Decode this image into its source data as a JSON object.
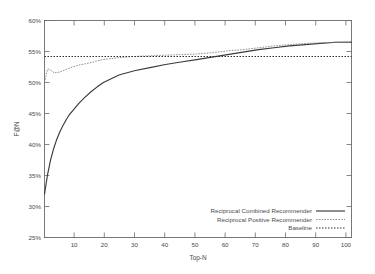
{
  "chart_data": {
    "type": "line",
    "title": "",
    "xlabel": "Top-N",
    "ylabel": "F@N",
    "xlim": [
      1,
      100
    ],
    "ylim": [
      25,
      60
    ],
    "grid": false,
    "legend_position": "bottom-right",
    "xticks": [
      10,
      20,
      30,
      40,
      50,
      60,
      70,
      80,
      90,
      100
    ],
    "xtick_labels": [
      "10",
      "20",
      "30",
      "40",
      "50",
      "60",
      "70",
      "80",
      "90",
      "100"
    ],
    "yticks": [
      25,
      30,
      35,
      40,
      45,
      50,
      55,
      60
    ],
    "ytick_labels": [
      "25%",
      "30%",
      "35%",
      "40%",
      "45%",
      "50%",
      "55%",
      "60%"
    ],
    "x": [
      1,
      2,
      3,
      4,
      5,
      6,
      7,
      8,
      9,
      10,
      12,
      14,
      16,
      18,
      20,
      25,
      30,
      35,
      40,
      45,
      50,
      55,
      60,
      65,
      70,
      75,
      80,
      85,
      90,
      95,
      100
    ],
    "series": [
      {
        "name": "Reciprocal Combined Recommender",
        "style": "solid",
        "color": "#3a3a3a",
        "values": [
          32.0,
          35.2,
          37.6,
          39.4,
          40.9,
          42.1,
          43.1,
          44.0,
          44.8,
          45.4,
          46.6,
          47.6,
          48.5,
          49.3,
          50.0,
          51.2,
          51.9,
          52.4,
          52.9,
          53.3,
          53.7,
          54.1,
          54.5,
          54.9,
          55.3,
          55.6,
          55.9,
          56.1,
          56.3,
          56.5,
          56.5
        ]
      },
      {
        "name": "Reciprocal Positive Recommender",
        "style": "dashed",
        "color": "#8a8a8a",
        "values": [
          50.0,
          52.2,
          52.0,
          51.6,
          51.6,
          51.7,
          51.9,
          52.1,
          52.3,
          52.5,
          52.8,
          53.0,
          53.2,
          53.5,
          53.7,
          54.0,
          54.2,
          54.3,
          54.4,
          54.5,
          54.6,
          54.8,
          55.1,
          55.3,
          55.6,
          55.9,
          56.1,
          56.3,
          56.4,
          56.5,
          56.6
        ]
      },
      {
        "name": "Baseline",
        "style": "dotted",
        "color": "#3a3a3a",
        "constant": 54.2,
        "values": [
          54.2,
          54.2,
          54.2,
          54.2,
          54.2,
          54.2,
          54.2,
          54.2,
          54.2,
          54.2,
          54.2,
          54.2,
          54.2,
          54.2,
          54.2,
          54.2,
          54.2,
          54.2,
          54.2,
          54.2,
          54.2,
          54.2,
          54.2,
          54.2,
          54.2,
          54.2,
          54.2,
          54.2,
          54.2,
          54.2,
          54.2
        ]
      }
    ]
  },
  "legend": {
    "items": [
      {
        "label": "Reciprocal Combined Recommender",
        "style": "solid"
      },
      {
        "label": "Reciprocal Positive Recommender",
        "style": "dashed"
      },
      {
        "label": "Baseline",
        "style": "dotted"
      }
    ]
  },
  "colors": {
    "background": "#ffffff",
    "axis": "#6b6b6b",
    "text": "#4a4a4a",
    "series_combined": "#3a3a3a",
    "series_positive": "#8a8a8a",
    "series_baseline": "#3a3a3a"
  }
}
